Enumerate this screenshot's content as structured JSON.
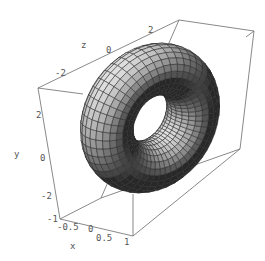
{
  "chart_data": {
    "type": "surface3d",
    "title": "",
    "surface": "torus",
    "parametric": {
      "major_radius": 2,
      "minor_radius": 1,
      "u_segments": 48,
      "v_segments": 24
    },
    "axes": {
      "x": {
        "label": "x",
        "ticks": [
          "-1",
          "-0.5",
          "0",
          "0.5",
          "1"
        ],
        "range": [
          -1,
          1
        ]
      },
      "y": {
        "label": "y",
        "ticks": [
          "-2",
          "0",
          "2"
        ],
        "range": [
          -3,
          3
        ]
      },
      "z": {
        "label": "z",
        "ticks": [
          "-2",
          "0",
          "2"
        ],
        "range": [
          -3,
          3
        ]
      }
    },
    "box": true,
    "grid": false,
    "legend": null,
    "colors": {
      "surface_light": "#d8d8d8",
      "surface_dark": "#1a1a1a",
      "mesh": "#2a2a2a",
      "box": "#6b6b6b",
      "text": "#555555"
    }
  },
  "labels": {
    "x_axis": "x",
    "y_axis": "y",
    "z_axis": "z",
    "x_ticks": [
      {
        "text": "-1",
        "x": 47,
        "y": 222
      },
      {
        "text": "-0.5",
        "x": 57,
        "y": 230
      },
      {
        "text": "0",
        "x": 88,
        "y": 232
      },
      {
        "text": "0.5",
        "x": 96,
        "y": 241
      },
      {
        "text": "1",
        "x": 124,
        "y": 245
      }
    ],
    "y_ticks": [
      {
        "text": "2",
        "x": 36,
        "y": 118
      },
      {
        "text": "0",
        "x": 40,
        "y": 161
      },
      {
        "text": "-2",
        "x": 41,
        "y": 199
      }
    ],
    "z_ticks": [
      {
        "text": "-2",
        "x": 55,
        "y": 76
      },
      {
        "text": "0",
        "x": 106,
        "y": 53
      },
      {
        "text": "2",
        "x": 148,
        "y": 33
      }
    ],
    "x_label_pos": {
      "x": 70,
      "y": 249
    },
    "y_label_pos": {
      "x": 14,
      "y": 157
    },
    "z_label_pos": {
      "x": 81,
      "y": 48
    }
  },
  "box_corners": {
    "top_front_left": [
      38,
      88
    ],
    "top_back_left": [
      179,
      20
    ],
    "top_back_right": [
      254,
      31
    ],
    "top_front_right": [
      113,
      100
    ],
    "bottom_front_left": [
      60,
      219
    ],
    "bottom_back_left": [
      101,
      198
    ],
    "bottom_back_right": [
      240,
      149
    ],
    "bottom_front_right": [
      133,
      236
    ]
  }
}
